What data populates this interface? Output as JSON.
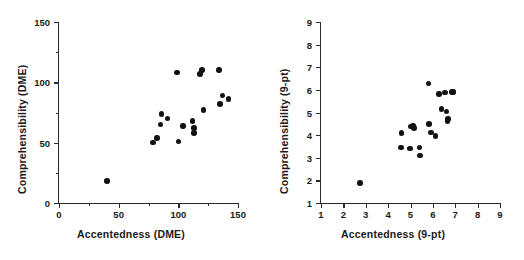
{
  "figure": {
    "background": "#ffffff",
    "marker_color": "#121212",
    "axis_color": "#2b2b2b",
    "panel_count": 2
  },
  "chart_data": [
    {
      "type": "scatter",
      "panel": "left",
      "title": "",
      "xlabel": "Accentedness (DME)",
      "ylabel": "Comprehensibility (DME)",
      "xlim": [
        0,
        150
      ],
      "ylim": [
        0,
        150
      ],
      "xticks": [
        0,
        50,
        100,
        150
      ],
      "xticklabels": [
        "0",
        "50",
        "100",
        "150"
      ],
      "xminorticks": [
        25,
        75,
        125
      ],
      "yticks": [
        0,
        50,
        100,
        150
      ],
      "yticklabels": [
        "0",
        "50",
        "100",
        "150"
      ],
      "yminorticks": [
        25,
        75,
        125
      ],
      "grid": false,
      "legend": false,
      "points": [
        {
          "x": 40,
          "y": 18
        },
        {
          "x": 79,
          "y": 50
        },
        {
          "x": 82,
          "y": 54
        },
        {
          "x": 85,
          "y": 65
        },
        {
          "x": 86,
          "y": 74
        },
        {
          "x": 91,
          "y": 70
        },
        {
          "x": 99,
          "y": 108
        },
        {
          "x": 100,
          "y": 51
        },
        {
          "x": 104,
          "y": 64
        },
        {
          "x": 112,
          "y": 68
        },
        {
          "x": 113,
          "y": 62
        },
        {
          "x": 113,
          "y": 58
        },
        {
          "x": 118,
          "y": 107
        },
        {
          "x": 120,
          "y": 110
        },
        {
          "x": 121,
          "y": 77
        },
        {
          "x": 134,
          "y": 110
        },
        {
          "x": 135,
          "y": 82
        },
        {
          "x": 137,
          "y": 89
        },
        {
          "x": 142,
          "y": 86
        }
      ]
    },
    {
      "type": "scatter",
      "panel": "right",
      "title": "",
      "xlabel": "Accentedness (9-pt)",
      "ylabel": "Comprehensibility (9-pt)",
      "xlim": [
        1,
        9
      ],
      "ylim": [
        1,
        9
      ],
      "xticks": [
        1,
        2,
        3,
        4,
        5,
        6,
        7,
        8,
        9
      ],
      "xticklabels": [
        "1",
        "2",
        "3",
        "4",
        "5",
        "6",
        "7",
        "8",
        "9"
      ],
      "yticks": [
        1,
        2,
        3,
        4,
        5,
        6,
        7,
        8,
        9
      ],
      "yticklabels": [
        "1",
        "2",
        "3",
        "4",
        "5",
        "6",
        "7",
        "8",
        "9"
      ],
      "grid": false,
      "legend": false,
      "points": [
        {
          "x": 2.75,
          "y": 1.88
        },
        {
          "x": 4.58,
          "y": 3.45
        },
        {
          "x": 4.6,
          "y": 4.1
        },
        {
          "x": 4.98,
          "y": 3.4
        },
        {
          "x": 5.02,
          "y": 4.38
        },
        {
          "x": 5.12,
          "y": 4.42
        },
        {
          "x": 5.15,
          "y": 4.32
        },
        {
          "x": 5.4,
          "y": 3.45
        },
        {
          "x": 5.42,
          "y": 3.1
        },
        {
          "x": 5.8,
          "y": 6.28
        },
        {
          "x": 5.82,
          "y": 4.48
        },
        {
          "x": 5.92,
          "y": 4.12
        },
        {
          "x": 6.12,
          "y": 3.95
        },
        {
          "x": 6.28,
          "y": 5.83
        },
        {
          "x": 6.38,
          "y": 5.15
        },
        {
          "x": 6.55,
          "y": 5.88
        },
        {
          "x": 6.6,
          "y": 5.05
        },
        {
          "x": 6.65,
          "y": 4.62
        },
        {
          "x": 6.68,
          "y": 4.72
        },
        {
          "x": 6.85,
          "y": 5.9
        },
        {
          "x": 6.92,
          "y": 5.9
        }
      ]
    }
  ]
}
